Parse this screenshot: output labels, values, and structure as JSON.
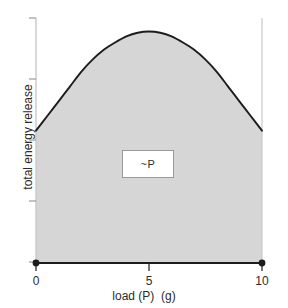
{
  "chart_data": {
    "type": "area",
    "title": "",
    "xlabel": "load (P)  (g)",
    "ylabel": "total energy release",
    "xlim": [
      0,
      10
    ],
    "ylim": [
      0,
      1
    ],
    "grid": false,
    "legend_position": "none",
    "x_ticks": [
      {
        "value": 0,
        "label": "0"
      },
      {
        "value": 5,
        "label": "5"
      },
      {
        "value": 10,
        "label": "10"
      }
    ],
    "y_ticks": [
      {
        "value": 0.0,
        "label": ""
      },
      {
        "value": 0.25,
        "label": ""
      },
      {
        "value": 0.5,
        "label": ""
      },
      {
        "value": 0.75,
        "label": ""
      },
      {
        "value": 1.0,
        "label": ""
      }
    ],
    "series": [
      {
        "name": "total energy release",
        "fill": true,
        "fill_color": "#d6d6d6",
        "line_color": "#1c1c1c",
        "x": [
          0,
          0.5,
          1,
          1.5,
          2,
          2.5,
          3,
          3.5,
          4,
          4.5,
          5,
          5.5,
          6,
          6.5,
          7,
          7.5,
          8,
          8.5,
          9,
          9.5,
          10
        ],
        "y": [
          0.54,
          0.6,
          0.66,
          0.72,
          0.78,
          0.83,
          0.87,
          0.9,
          0.925,
          0.94,
          0.945,
          0.94,
          0.925,
          0.9,
          0.87,
          0.83,
          0.78,
          0.72,
          0.66,
          0.6,
          0.54
        ]
      }
    ],
    "markers": [
      {
        "x": 0,
        "y": 0,
        "shape": "circle",
        "color": "#1c1c1c"
      },
      {
        "x": 10,
        "y": 0,
        "shape": "circle",
        "color": "#1c1c1c"
      }
    ],
    "annotations": [
      {
        "text": "~P",
        "x": 5,
        "y": 0.43,
        "boxed": true,
        "box_fill": "#ffffff",
        "box_border": "#9a9a9a"
      }
    ],
    "reference_lines": [
      {
        "orientation": "vertical",
        "x": 10,
        "color": "#c9c9c9"
      }
    ],
    "colors": {
      "axis_y": "#c9c9c9",
      "axis_x": "#1c1c1c",
      "curve": "#1c1c1c",
      "fill": "#d6d6d6",
      "text": "#2b2b2b",
      "background": "#ffffff"
    }
  },
  "labels": {
    "x_tick_0": "0",
    "x_tick_5": "5",
    "x_tick_10": "10",
    "xaxis_title": "load (P)  (g)",
    "yaxis_title": "total energy release",
    "region_annotation": "~P"
  }
}
